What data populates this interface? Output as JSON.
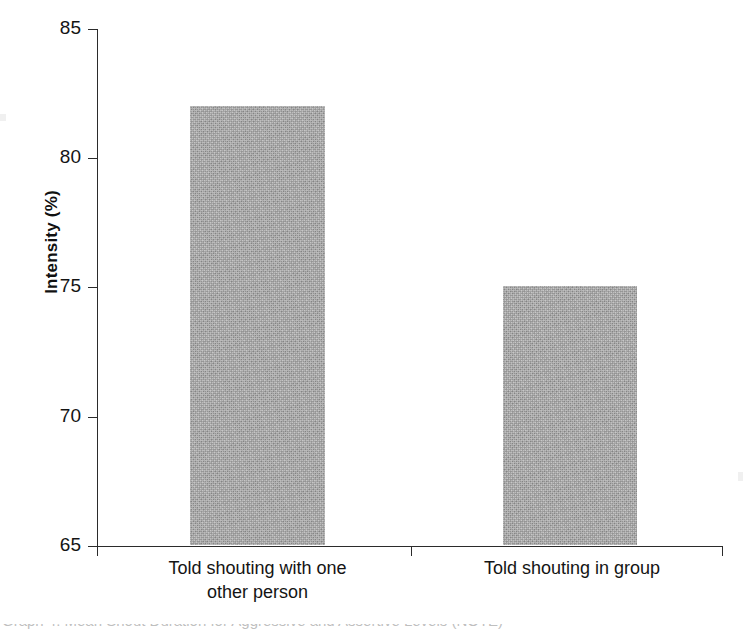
{
  "chart_data": {
    "type": "bar",
    "title": "",
    "subtitle": "",
    "xlabel": "",
    "ylabel": "Intensity (%)",
    "categories": [
      "Told shouting with one other person",
      "Told shouting in group"
    ],
    "values": [
      82.0,
      75.0
    ],
    "ylim": [
      65,
      85
    ],
    "yticks": [
      85,
      80,
      75,
      70,
      65
    ],
    "ytick_labels": [
      "85",
      "80",
      "75",
      "70",
      "65"
    ],
    "grid": false,
    "legend": null,
    "bar_color": "#a3a3a3",
    "axis_color": "#2b2b2b",
    "series": [
      {
        "name": "Intensity",
        "values": [
          82.0,
          75.0
        ]
      }
    ]
  },
  "axis": {
    "ylabel": "Intensity (%)",
    "ticks": [
      {
        "label": "85",
        "value": 85
      },
      {
        "label": "80",
        "value": 80
      },
      {
        "label": "75",
        "value": 75
      },
      {
        "label": "70",
        "value": 70
      },
      {
        "label": "65",
        "value": 65
      }
    ]
  },
  "categories": [
    {
      "line1": "Told shouting with one",
      "line2": "other person",
      "full": "Told shouting with one other person"
    },
    {
      "line1": "Told shouting in group",
      "line2": "",
      "full": "Told shouting in group"
    }
  ],
  "caption": {
    "clipped_text": "Graph 4. Mean Shout Duration for Aggressive and Assertive Levels (NOTE)"
  }
}
